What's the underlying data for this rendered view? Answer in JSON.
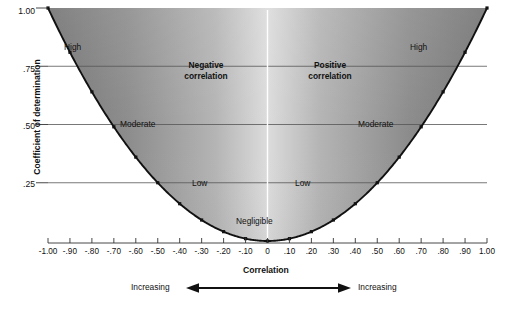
{
  "chart_data": {
    "type": "line",
    "title": "",
    "xlabel": "Correlation",
    "ylabel": "Coefficient of determination",
    "xlim": [
      -1.0,
      1.0
    ],
    "ylim": [
      0.0,
      1.0
    ],
    "grid": true,
    "legend": "none",
    "x": [
      -1.0,
      -0.9,
      -0.8,
      -0.7,
      -0.6,
      -0.5,
      -0.4,
      -0.3,
      -0.2,
      -0.1,
      0.0,
      0.1,
      0.2,
      0.3,
      0.4,
      0.5,
      0.6,
      0.7,
      0.8,
      0.9,
      1.0
    ],
    "values": [
      1.0,
      0.81,
      0.64,
      0.49,
      0.36,
      0.25,
      0.16,
      0.09,
      0.04,
      0.01,
      0.0,
      0.01,
      0.04,
      0.09,
      0.16,
      0.25,
      0.36,
      0.49,
      0.64,
      0.81,
      1.0
    ],
    "series": [
      {
        "name": "r squared",
        "values": [
          1.0,
          0.81,
          0.64,
          0.49,
          0.36,
          0.25,
          0.16,
          0.09,
          0.04,
          0.01,
          0.0,
          0.01,
          0.04,
          0.09,
          0.16,
          0.25,
          0.36,
          0.49,
          0.64,
          0.81,
          1.0
        ]
      }
    ],
    "xticklabels": [
      "-1.00",
      "-.90",
      "-.80",
      "-.70",
      "-.60",
      "-.50",
      "-.40",
      "-.30",
      "-.20",
      "-.10",
      "0",
      ".10",
      ".20",
      ".30",
      ".40",
      ".50",
      ".60",
      ".70",
      ".80",
      ".90",
      "1.00"
    ],
    "xtickvalues": [
      -1.0,
      -0.9,
      -0.8,
      -0.7,
      -0.6,
      -0.5,
      -0.4,
      -0.3,
      -0.2,
      -0.1,
      0.0,
      0.1,
      0.2,
      0.3,
      0.4,
      0.5,
      0.6,
      0.7,
      0.8,
      0.9,
      1.0
    ],
    "yticklabels": [
      "1.00",
      ".75",
      ".50",
      ".25"
    ],
    "ytickvalues": [
      1.0,
      0.75,
      0.5,
      0.25
    ],
    "gridline_values": [
      0.75,
      0.5,
      0.25
    ],
    "annotations": [
      {
        "text": "High",
        "x": -0.83,
        "y": 0.86
      },
      {
        "text": "Negative correlation",
        "x": -0.47,
        "y": 0.7
      },
      {
        "text": "Moderate",
        "x": -0.66,
        "y": 0.5
      },
      {
        "text": "Low",
        "x": -0.3,
        "y": 0.25
      },
      {
        "text": "Negligible",
        "x": -0.04,
        "y": 0.08
      },
      {
        "text": "Low",
        "x": 0.18,
        "y": 0.25
      },
      {
        "text": "Moderate",
        "x": 0.63,
        "y": 0.5
      },
      {
        "text": "Positive correlation",
        "x": 0.42,
        "y": 0.7
      },
      {
        "text": "High",
        "x": 0.8,
        "y": 0.86
      }
    ],
    "colors": {
      "curve": "#111111",
      "fill_edge": "#7d7d7d",
      "fill_center": "#d9d9d9",
      "gridline": "#4d4d4d",
      "center_line": "#ffffff",
      "background": "#ffffff",
      "text": "#111111"
    }
  },
  "axis": {
    "y_title": "Coefficient of determination",
    "x_title": "Correlation",
    "y_ticks": [
      "1.00",
      ".75",
      ".50",
      ".25"
    ],
    "x_ticks": [
      "-1.00",
      "-.90",
      "-.80",
      "-.70",
      "-.60",
      "-.50",
      "-.40",
      "-.30",
      "-.20",
      "-.10",
      "0",
      ".10",
      ".20",
      ".30",
      ".40",
      ".50",
      ".60",
      ".70",
      ".80",
      ".90",
      "1.00"
    ]
  },
  "labels": {
    "high_left": "High",
    "high_right": "High",
    "moderate_left": "Moderate",
    "moderate_right": "Moderate",
    "low_left": "Low",
    "low_right": "Low",
    "negligible": "Negligible",
    "negative_correlation_line1": "Negative",
    "negative_correlation_line2": "correlation",
    "positive_correlation_line1": "Positive",
    "positive_correlation_line2": "correlation",
    "increasing_left": "Increasing",
    "increasing_right": "Increasing"
  }
}
